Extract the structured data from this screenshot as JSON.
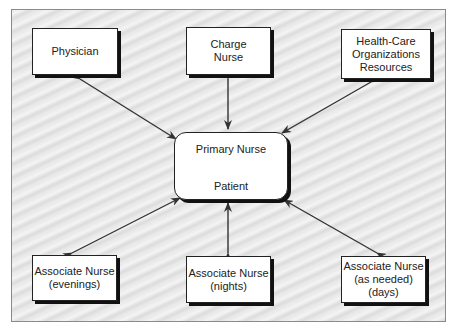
{
  "diagram": {
    "center": {
      "top_label": "Primary Nurse",
      "bottom_label": "Patient"
    },
    "nodes": [
      {
        "id": "physician",
        "lines": [
          "Physician"
        ]
      },
      {
        "id": "charge-nurse",
        "lines": [
          "Charge",
          "Nurse"
        ]
      },
      {
        "id": "health-care",
        "lines": [
          "Health-Care",
          "Organizations",
          "Resources"
        ]
      },
      {
        "id": "associate-evenings",
        "lines": [
          "Associate Nurse",
          "(evenings)"
        ]
      },
      {
        "id": "associate-nights",
        "lines": [
          "Associate Nurse",
          "(nights)"
        ]
      },
      {
        "id": "associate-days",
        "lines": [
          "Associate Nurse",
          "(as needed)",
          "(days)"
        ]
      }
    ],
    "edges": [
      {
        "from": "physician",
        "to": "center",
        "bidirectional": true
      },
      {
        "from": "charge-nurse",
        "to": "center",
        "bidirectional": true
      },
      {
        "from": "health-care",
        "to": "center",
        "bidirectional": true
      },
      {
        "from": "associate-evenings",
        "to": "center",
        "bidirectional": true
      },
      {
        "from": "associate-nights",
        "to": "center",
        "bidirectional": true
      },
      {
        "from": "associate-days",
        "to": "center",
        "bidirectional": true
      },
      {
        "from": "primary-nurse",
        "to": "patient",
        "bidirectional": true
      }
    ]
  }
}
